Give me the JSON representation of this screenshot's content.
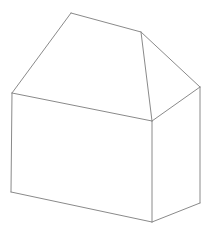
{
  "scene": {
    "title": "3D wireframe house",
    "width": 212,
    "height": 235,
    "background_color": "#ffffff",
    "line_color": "#8a8a8a",
    "line_width": 1,
    "projection": "isometric-like oblique view",
    "description": "Line drawing of a simple house: rectangular box body with a hip/gable roof, viewed from a three-quarter angle showing the left wall, front-right wall, and two roof planes."
  },
  "geometry": {
    "vertices": {
      "ridge_left_peak": [
        71,
        13
      ],
      "ridge_right_end": [
        141,
        32
      ],
      "eave_left_corner": [
        12,
        93
      ],
      "eave_front_center": [
        152,
        121
      ],
      "eave_right_corner": [
        200,
        87
      ],
      "base_left_corner": [
        11,
        192
      ],
      "base_front_center": [
        152,
        222
      ],
      "base_right_corner": [
        200,
        203
      ]
    },
    "faces": [
      {
        "name": "roof-left-plane",
        "points": "71,13 141,32 152,121 12,93"
      },
      {
        "name": "roof-right-plane",
        "points": "141,32 200,87 152,121"
      },
      {
        "name": "wall-left",
        "points": "12,93 152,121 152,222 11,192"
      },
      {
        "name": "wall-right",
        "points": "152,121 200,87 200,203 152,222"
      }
    ],
    "edges": [
      {
        "name": "roof-ridge",
        "points": "71,13 141,32"
      },
      {
        "name": "roof-hip-left-front",
        "points": "71,13 12,93"
      },
      {
        "name": "roof-hip-right-rear",
        "points": "141,32 200,87"
      },
      {
        "name": "roof-valley-center",
        "points": "141,32 152,121"
      },
      {
        "name": "eave-left-front",
        "points": "12,93 152,121"
      },
      {
        "name": "eave-right-front",
        "points": "152,121 200,87"
      },
      {
        "name": "wall-edge-left-vertical",
        "points": "11,192 12,93"
      },
      {
        "name": "wall-edge-center-vertical",
        "points": "152,121 152,222"
      },
      {
        "name": "wall-edge-right-vertical",
        "points": "200,87 200,203"
      },
      {
        "name": "base-edge-left",
        "points": "11,192 152,222"
      },
      {
        "name": "base-edge-right",
        "points": "152,222 200,203"
      }
    ]
  }
}
